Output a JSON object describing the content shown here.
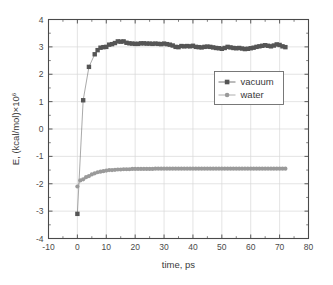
{
  "chart_data": {
    "type": "scatter",
    "title": "",
    "xlabel": "time, ps",
    "ylabel": "E, (kcal/mol)×10",
    "ylabel_exponent": "6",
    "xlim": [
      -10,
      80
    ],
    "ylim": [
      -4,
      4
    ],
    "xticks": [
      -10,
      0,
      10,
      20,
      30,
      40,
      50,
      60,
      70,
      80
    ],
    "yticks": [
      -4,
      -3,
      -2,
      -1,
      0,
      1,
      2,
      3,
      4
    ],
    "xtick_labels": [
      "-10",
      "0",
      "10",
      "20",
      "30",
      "40",
      "50",
      "60",
      "70",
      "80"
    ],
    "ytick_labels": [
      "-4",
      "-3",
      "-2",
      "-1",
      "0",
      "1",
      "2",
      "3",
      "4"
    ],
    "grid": true,
    "grid_color": "#d8d8d8",
    "legend_position": "upper-right-inside",
    "series": [
      {
        "name": "vacuum",
        "marker": "square",
        "color": "#555555",
        "line": true,
        "x": [
          0,
          2,
          4,
          6,
          7,
          8,
          9,
          10,
          11,
          12,
          13,
          14,
          15,
          16,
          17,
          18,
          19,
          20,
          21,
          22,
          23,
          24,
          25,
          26,
          27,
          28,
          29,
          30,
          31,
          32,
          33,
          34,
          35,
          36,
          37,
          38,
          39,
          40,
          41,
          42,
          43,
          44,
          45,
          46,
          47,
          48,
          49,
          50,
          51,
          52,
          53,
          54,
          55,
          56,
          57,
          58,
          59,
          60,
          61,
          62,
          63,
          64,
          65,
          66,
          67,
          68,
          69,
          70,
          71,
          72
        ],
        "y": [
          -3.1,
          1.05,
          2.27,
          2.73,
          2.88,
          2.97,
          2.99,
          3.0,
          3.08,
          3.1,
          3.14,
          3.2,
          3.19,
          3.2,
          3.15,
          3.13,
          3.12,
          3.11,
          3.11,
          3.13,
          3.13,
          3.12,
          3.12,
          3.11,
          3.12,
          3.11,
          3.1,
          3.12,
          3.1,
          3.08,
          3.05,
          3.0,
          2.99,
          3.03,
          3.02,
          3.03,
          3.02,
          3.04,
          3.0,
          2.99,
          2.98,
          3.0,
          3.01,
          3.0,
          2.98,
          2.96,
          2.95,
          2.93,
          2.96,
          3.0,
          2.98,
          2.96,
          2.95,
          2.96,
          2.94,
          2.92,
          2.93,
          2.95,
          2.97,
          3.0,
          3.02,
          3.04,
          3.06,
          3.04,
          3.02,
          3.05,
          3.09,
          3.07,
          3.02,
          2.99
        ]
      },
      {
        "name": "water",
        "marker": "circle",
        "color": "#9a9a9a",
        "line": true,
        "x": [
          0,
          1,
          2,
          3,
          4,
          5,
          6,
          7,
          8,
          9,
          10,
          11,
          12,
          13,
          14,
          15,
          16,
          17,
          18,
          19,
          20,
          21,
          22,
          23,
          24,
          25,
          26,
          27,
          28,
          29,
          30,
          31,
          32,
          33,
          34,
          35,
          36,
          37,
          38,
          39,
          40,
          41,
          42,
          43,
          44,
          45,
          46,
          47,
          48,
          49,
          50,
          51,
          52,
          53,
          54,
          55,
          56,
          57,
          58,
          59,
          60,
          61,
          62,
          63,
          64,
          65,
          66,
          67,
          68,
          69,
          70,
          71,
          72
        ],
        "y": [
          -2.1,
          -1.88,
          -1.84,
          -1.76,
          -1.72,
          -1.66,
          -1.62,
          -1.58,
          -1.56,
          -1.54,
          -1.52,
          -1.5,
          -1.5,
          -1.49,
          -1.48,
          -1.48,
          -1.47,
          -1.47,
          -1.47,
          -1.46,
          -1.46,
          -1.46,
          -1.46,
          -1.46,
          -1.46,
          -1.46,
          -1.46,
          -1.45,
          -1.45,
          -1.45,
          -1.45,
          -1.45,
          -1.45,
          -1.45,
          -1.45,
          -1.45,
          -1.45,
          -1.45,
          -1.45,
          -1.45,
          -1.45,
          -1.45,
          -1.45,
          -1.45,
          -1.45,
          -1.45,
          -1.45,
          -1.45,
          -1.45,
          -1.45,
          -1.45,
          -1.45,
          -1.45,
          -1.45,
          -1.45,
          -1.45,
          -1.45,
          -1.45,
          -1.45,
          -1.45,
          -1.45,
          -1.45,
          -1.45,
          -1.45,
          -1.45,
          -1.45,
          -1.45,
          -1.45,
          -1.45,
          -1.45,
          -1.45,
          -1.45,
          -1.45
        ]
      }
    ],
    "legend_entries": [
      {
        "label": "vacuum",
        "marker": "square",
        "color": "#555555"
      },
      {
        "label": "water",
        "marker": "circle",
        "color": "#9a9a9a"
      }
    ]
  }
}
